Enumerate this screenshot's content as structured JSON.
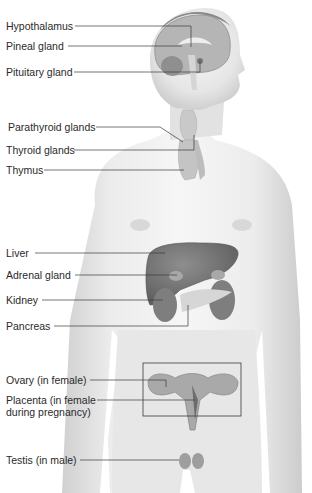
{
  "diagram": {
    "labels": [
      {
        "id": "hypothalamus",
        "text": "Hypothalamus"
      },
      {
        "id": "pineal",
        "text": "Pineal gland"
      },
      {
        "id": "pituitary",
        "text": "Pituitary gland"
      },
      {
        "id": "parathyroid",
        "text": "Parathyroid glands"
      },
      {
        "id": "thyroid",
        "text": "Thyroid glands"
      },
      {
        "id": "thymus",
        "text": "Thymus"
      },
      {
        "id": "liver",
        "text": "Liver"
      },
      {
        "id": "adrenal",
        "text": "Adrenal gland"
      },
      {
        "id": "kidney",
        "text": "Kidney"
      },
      {
        "id": "pancreas",
        "text": "Pancreas"
      },
      {
        "id": "ovary",
        "text": "Ovary (in female)"
      },
      {
        "id": "placenta_line1",
        "text": "Placenta (in female"
      },
      {
        "id": "placenta_line2",
        "text": "during pregnancy)"
      },
      {
        "id": "testis",
        "text": "Testis (in male)"
      }
    ],
    "colors": {
      "skin_light": "#f2f2f2",
      "skin_shade": "#d4d4d4",
      "organ_dark": "#7a7a7a",
      "organ_mid": "#9a9a9a",
      "gland_light": "#c8c8c8",
      "leader_line": "#3a3a3a"
    }
  }
}
